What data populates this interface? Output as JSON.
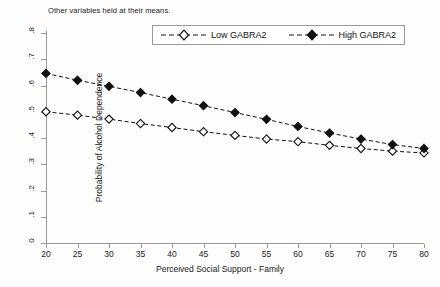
{
  "note": "Other variables held at their means.",
  "legend": {
    "position": "top-center",
    "items": [
      {
        "label": "Low GABRA2",
        "marker": "open-diamond"
      },
      {
        "label": "High GABRA2",
        "marker": "filled-diamond"
      }
    ]
  },
  "axes": {
    "xlabel": "Perceived Social Support - Family",
    "ylabel": "Probability of Alcohol Dependence",
    "xticks": [
      "20",
      "25",
      "30",
      "35",
      "40",
      "45",
      "50",
      "55",
      "60",
      "65",
      "70",
      "75",
      "80"
    ],
    "yticks": [
      "0",
      ".1",
      ".2",
      ".3",
      ".4",
      ".5",
      ".6",
      ".7",
      ".8"
    ],
    "xlim": [
      20,
      80
    ],
    "ylim": [
      0,
      0.8
    ]
  },
  "colors": {
    "line": "#111111",
    "marker_fill_high": "#111111",
    "marker_fill_low": "#ffffff",
    "axis": "#9a9a9a",
    "background": "#ffffff"
  },
  "chart_data": {
    "type": "line",
    "title": "",
    "subtitle": "Other variables held at their means.",
    "xlabel": "Perceived Social Support - Family",
    "ylabel": "Probability of Alcohol Dependence",
    "xlim": [
      20,
      80
    ],
    "ylim": [
      0,
      0.8
    ],
    "grid": false,
    "legend_position": "top-center",
    "x": [
      20,
      25,
      30,
      35,
      40,
      45,
      50,
      55,
      60,
      65,
      70,
      75,
      80
    ],
    "series": [
      {
        "name": "Low GABRA2",
        "marker": "open-diamond",
        "linestyle": "dashed",
        "values": [
          0.5,
          0.487,
          0.472,
          0.455,
          0.44,
          0.424,
          0.41,
          0.396,
          0.386,
          0.372,
          0.36,
          0.35,
          0.343
        ]
      },
      {
        "name": "High GABRA2",
        "marker": "filled-diamond",
        "linestyle": "dashed",
        "values": [
          0.646,
          0.62,
          0.597,
          0.573,
          0.548,
          0.523,
          0.497,
          0.471,
          0.444,
          0.419,
          0.396,
          0.375,
          0.36
        ]
      }
    ]
  }
}
